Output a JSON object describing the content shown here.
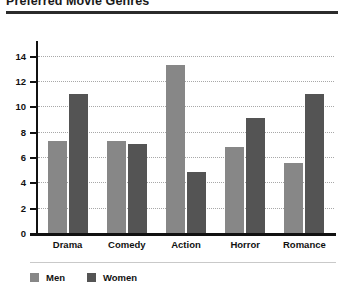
{
  "chart_data": {
    "type": "bar",
    "title": "Preferred Movie Genres",
    "xlabel": "",
    "ylabel": "",
    "ylim": [
      0,
      15
    ],
    "yticks": [
      0,
      2,
      4,
      6,
      8,
      10,
      12,
      14
    ],
    "grid": true,
    "legend_position": "bottom-left",
    "categories": [
      "Drama",
      "Comedy",
      "Action",
      "Horror",
      "Romance"
    ],
    "series": [
      {
        "name": "Men",
        "color": "#878787",
        "values": [
          7.3,
          7.3,
          13.3,
          6.8,
          5.5
        ]
      },
      {
        "name": "Women",
        "color": "#545454",
        "values": [
          11.0,
          7.0,
          4.8,
          9.1,
          11.0
        ]
      }
    ]
  },
  "legend": {
    "items": [
      {
        "label": "Men",
        "color": "#878787"
      },
      {
        "label": "Women",
        "color": "#545454"
      }
    ]
  }
}
